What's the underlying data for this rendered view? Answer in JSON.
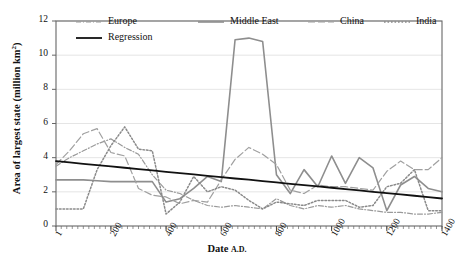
{
  "chart_data": {
    "type": "line",
    "title": "",
    "xlabel": "Date A.D.",
    "ylabel": "Area of largest state (million km²)",
    "xlim": [
      1,
      1400
    ],
    "ylim": [
      0,
      12
    ],
    "grid": true,
    "legend_position": "top-inside",
    "xticks": [
      1,
      200,
      400,
      600,
      800,
      1000,
      1200,
      1400
    ],
    "xtick_labels": [
      "1",
      "200",
      "400",
      "600",
      "800",
      "1000",
      "1200",
      "1400"
    ],
    "yticks": [
      0,
      2,
      4,
      6,
      8,
      10,
      12
    ],
    "ytick_labels": [
      "0",
      "2",
      "4",
      "6",
      "8",
      "10",
      "12"
    ],
    "x": [
      1,
      50,
      100,
      150,
      200,
      250,
      300,
      350,
      400,
      450,
      500,
      550,
      600,
      650,
      700,
      750,
      800,
      850,
      900,
      950,
      1000,
      1050,
      1100,
      1150,
      1200,
      1250,
      1300,
      1350,
      1400
    ],
    "series": [
      {
        "name": "Europe",
        "style": "dash-dot",
        "color": "#9a9a9a",
        "values": [
          3.5,
          4.0,
          4.4,
          4.8,
          5.1,
          4.6,
          4.2,
          3.0,
          2.1,
          1.9,
          1.5,
          1.2,
          1.1,
          1.2,
          1.1,
          1.0,
          1.6,
          1.2,
          1.0,
          1.2,
          1.1,
          1.2,
          1.0,
          0.9,
          0.8,
          0.8,
          0.7,
          0.7,
          0.8
        ]
      },
      {
        "name": "Middle East",
        "style": "solid",
        "color": "#8e8e8e",
        "values": [
          2.7,
          2.7,
          2.7,
          2.65,
          2.6,
          2.6,
          2.6,
          2.6,
          1.4,
          1.6,
          2.2,
          2.9,
          2.6,
          10.9,
          11.0,
          10.8,
          3.0,
          1.9,
          3.3,
          2.3,
          4.1,
          2.5,
          4.0,
          3.4,
          0.9,
          2.4,
          2.9,
          2.2,
          2.0
        ]
      },
      {
        "name": "China",
        "style": "long-dash",
        "color": "#a0a0a0",
        "values": [
          3.6,
          4.4,
          5.4,
          5.7,
          4.3,
          4.1,
          2.2,
          1.8,
          1.7,
          1.3,
          1.5,
          1.4,
          2.7,
          3.9,
          4.6,
          4.2,
          3.6,
          2.1,
          1.9,
          2.4,
          2.3,
          2.3,
          2.2,
          2.1,
          3.2,
          3.8,
          3.3,
          3.3,
          4.0
        ]
      },
      {
        "name": "India",
        "style": "dotted",
        "color": "#8a8a8a",
        "values": [
          1.0,
          1.0,
          1.0,
          3.3,
          4.7,
          5.8,
          4.5,
          4.4,
          0.7,
          1.4,
          2.9,
          2.0,
          2.3,
          2.1,
          1.5,
          1.0,
          1.4,
          1.3,
          1.2,
          1.5,
          1.5,
          1.5,
          1.1,
          1.2,
          2.3,
          2.5,
          3.3,
          0.9,
          0.9
        ]
      },
      {
        "name": "Regression",
        "style": "solid-black",
        "color": "#111111",
        "values": [
          3.8,
          3.72,
          3.64,
          3.56,
          3.49,
          3.41,
          3.33,
          3.25,
          3.17,
          3.1,
          3.02,
          2.94,
          2.86,
          2.78,
          2.71,
          2.63,
          2.55,
          2.47,
          2.39,
          2.32,
          2.24,
          2.16,
          2.08,
          2.0,
          1.93,
          1.85,
          1.77,
          1.69,
          1.61
        ]
      }
    ],
    "legend": [
      {
        "label": "Europe",
        "style": "dash-dot",
        "color": "#9a9a9a"
      },
      {
        "label": "Middle East",
        "style": "solid",
        "color": "#8e8e8e"
      },
      {
        "label": "China",
        "style": "long-dash",
        "color": "#a0a0a0"
      },
      {
        "label": "India",
        "style": "dotted",
        "color": "#8a8a8a"
      },
      {
        "label": "Regression",
        "style": "solid-black",
        "color": "#111111"
      }
    ]
  },
  "axes": {
    "ylabel_main": "Area of largest state (million km",
    "ylabel_sup": "2",
    "ylabel_close": ")",
    "xlabel_main": "Date",
    "xlabel_suffix": "A.D."
  }
}
